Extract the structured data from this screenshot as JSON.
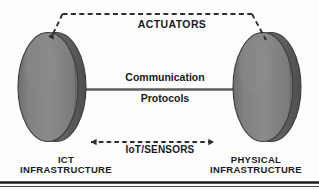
{
  "diagram": {
    "title_text": "ACTUATORS",
    "background_color": "#fdfdfd",
    "nodes": {
      "left": {
        "label_line1": "ICT",
        "label_line2": "INFRASTRUCTURE",
        "shape": "cylinder-disc",
        "face_color": "#7d7d7d",
        "band_color": "#5a5a5a",
        "outline_color": "#3d3d3d"
      },
      "right": {
        "label_line1": "PHYSICAL",
        "label_line2": "INFRASTRUCTURE",
        "shape": "cylinder-disc",
        "face_color": "#7d7d7d",
        "band_color": "#5a5a5a",
        "outline_color": "#3d3d3d"
      }
    },
    "connectors": {
      "top": {
        "label": "ACTUATORS",
        "style": "dashed",
        "arrow": "single-left",
        "color": "#2e2e2e"
      },
      "middle": {
        "label_line1": "Communication",
        "label_line2": "Protocols",
        "style": "solid",
        "arrow": "none",
        "color": "#5e5e5e"
      },
      "bottom": {
        "label": "IoT/SENSORS",
        "style": "dashed",
        "arrow": "double",
        "color": "#2e2e2e"
      }
    },
    "footer_rule_color": "#1e1e1e"
  }
}
